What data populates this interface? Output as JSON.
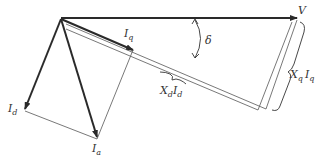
{
  "diagram": {
    "type": "phasor-diagram",
    "colors": {
      "line": "#2a2a2a",
      "thin": "#555555",
      "background": "#ffffff"
    },
    "labels": {
      "V": {
        "main": "V",
        "sub": ""
      },
      "Iq": {
        "main": "I",
        "sub": "q"
      },
      "Id": {
        "main": "I",
        "sub": "d"
      },
      "Ia": {
        "main": "I",
        "sub": "a"
      },
      "delta": {
        "main": "δ",
        "sub": ""
      },
      "XdId": {
        "main1": "X",
        "sub1": "d",
        "main2": "I",
        "sub2": "d"
      },
      "XqIq": {
        "main1": "X",
        "sub1": "q",
        "main2": "I",
        "sub2": "q"
      }
    }
  }
}
